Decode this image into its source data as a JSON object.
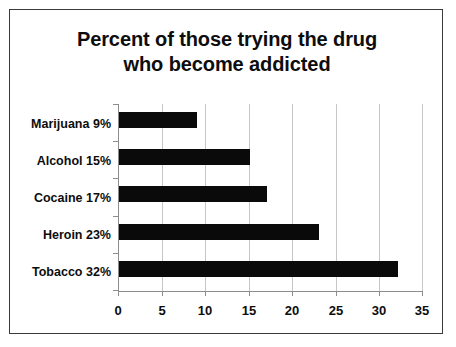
{
  "chart_data": {
    "type": "bar",
    "orientation": "horizontal",
    "title": "Percent of those trying the drug who become addicted",
    "title_lines": [
      "Percent of those trying the drug",
      "who become addicted"
    ],
    "xlabel": "",
    "ylabel": "",
    "xlim": [
      0,
      35
    ],
    "xticks": [
      0,
      5,
      10,
      15,
      20,
      25,
      30,
      35
    ],
    "xtick_labels": [
      "0",
      "5",
      "10",
      "15",
      "20",
      "25",
      "30",
      "35"
    ],
    "grid": true,
    "grid_axis": "x",
    "legend": false,
    "categories": [
      "Marijuana 9%",
      "Alcohol 15%",
      "Cocaine 17%",
      "Heroin 23%",
      "Tobacco 32%"
    ],
    "category_names": [
      "Marijuana",
      "Alcohol",
      "Cocaine",
      "Heroin",
      "Tobacco"
    ],
    "values": [
      9,
      15,
      17,
      23,
      32
    ],
    "value_labels": [
      "9%",
      "15%",
      "17%",
      "23%",
      "32%"
    ],
    "bar_color": "#0a0a0a",
    "grid_color": "#c6c6c6",
    "axis_color": "#8d8d8d",
    "text_color": "#0d0d0d",
    "background": "#ffffff",
    "border_color": "#3a3a3a"
  }
}
